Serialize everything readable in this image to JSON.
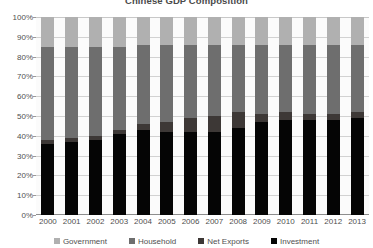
{
  "chart_data": {
    "type": "bar",
    "subtype": "stacked-percent",
    "title": "Chinese GDP Composition",
    "xlabel": "",
    "ylabel": "",
    "ylim": [
      0,
      100
    ],
    "ytick_labels": [
      "0%",
      "10%",
      "20%",
      "30%",
      "40%",
      "50%",
      "60%",
      "70%",
      "80%",
      "90%",
      "100%"
    ],
    "ytick_values": [
      0,
      10,
      20,
      30,
      40,
      50,
      60,
      70,
      80,
      90,
      100
    ],
    "grid": true,
    "legend_position": "bottom",
    "categories": [
      "2000",
      "2001",
      "2002",
      "2003",
      "2004",
      "2005",
      "2006",
      "2007",
      "2008",
      "2009",
      "2010",
      "2011",
      "2012",
      "2013"
    ],
    "series": [
      {
        "name": "Investment",
        "color": "#050505",
        "values": [
          36,
          37,
          38,
          41,
          43,
          42,
          42,
          42,
          44,
          47,
          48,
          48,
          48,
          49
        ]
      },
      {
        "name": "Net Exports",
        "color": "#3d3836",
        "values": [
          2,
          2,
          2,
          2,
          3,
          5,
          7,
          8,
          8,
          4,
          4,
          3,
          3,
          3
        ]
      },
      {
        "name": "Household",
        "color": "#6e6e6e",
        "values": [
          47,
          46,
          45,
          42,
          40,
          39,
          37,
          36,
          34,
          35,
          34,
          35,
          35,
          34
        ]
      },
      {
        "name": "Government",
        "color": "#b0b0b0",
        "values": [
          15,
          15,
          15,
          15,
          14,
          14,
          14,
          14,
          14,
          14,
          14,
          14,
          14,
          14
        ]
      }
    ]
  },
  "legend": {
    "items": [
      {
        "label": "Government",
        "color": "#b0b0b0",
        "swatch_name": "legend-swatch-government"
      },
      {
        "label": "Household",
        "color": "#6e6e6e",
        "swatch_name": "legend-swatch-household"
      },
      {
        "label": "Net Exports",
        "color": "#3d3836",
        "swatch_name": "legend-swatch-net-exports"
      },
      {
        "label": "Investment",
        "color": "#050505",
        "swatch_name": "legend-swatch-investment"
      }
    ]
  }
}
